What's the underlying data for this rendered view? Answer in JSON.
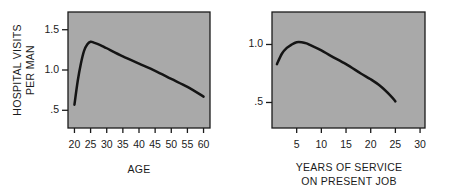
{
  "figure": {
    "background_color": "#ffffff",
    "panel_color": "#a9a9a9",
    "line_color": "#141414"
  },
  "chart_data": [
    {
      "type": "line",
      "title": "",
      "xlabel": "AGE",
      "ylabel": "HOSPITAL VISITS PER MAN",
      "ylabel_line1": "HOSPITAL VISITS",
      "ylabel_line2": "PER MAN",
      "xlim": [
        18,
        62
      ],
      "ylim": [
        0.28,
        1.72
      ],
      "xticks": [
        20,
        25,
        30,
        35,
        40,
        45,
        50,
        55,
        60
      ],
      "xticklabels": [
        "20",
        "25",
        "30",
        "35",
        "40",
        "45",
        "50",
        "55",
        "60"
      ],
      "yticks": [
        0.5,
        1.0,
        1.5
      ],
      "yticklabels": [
        ".5",
        "1.0",
        "1.5"
      ],
      "grid": false,
      "legend": "none",
      "x": [
        20,
        21,
        22,
        23,
        24,
        25,
        26,
        28,
        30,
        35,
        40,
        45,
        50,
        55,
        60
      ],
      "values": [
        0.57,
        0.86,
        1.08,
        1.24,
        1.32,
        1.35,
        1.34,
        1.31,
        1.27,
        1.17,
        1.08,
        0.99,
        0.89,
        0.79,
        0.67
      ]
    },
    {
      "type": "line",
      "title": "",
      "xlabel": "YEARS OF SERVICE ON PRESENT JOB",
      "xlabel_line1": "YEARS OF SERVICE",
      "xlabel_line2": "ON PRESENT JOB",
      "ylabel": "",
      "xlim": [
        0,
        31
      ],
      "ylim": [
        0.28,
        1.28
      ],
      "xticks": [
        5,
        10,
        15,
        20,
        25,
        30
      ],
      "xticklabels": [
        "5",
        "10",
        "15",
        "20",
        "25",
        "30"
      ],
      "yticks": [
        0.5,
        1.0
      ],
      "yticklabels": [
        ".5",
        "1.0"
      ],
      "grid": false,
      "legend": "none",
      "x": [
        1,
        2,
        3,
        4,
        5,
        6,
        7,
        8,
        10,
        12,
        15,
        18,
        20,
        22,
        24,
        25
      ],
      "values": [
        0.83,
        0.92,
        0.97,
        1.0,
        1.02,
        1.02,
        1.01,
        0.99,
        0.95,
        0.9,
        0.83,
        0.75,
        0.7,
        0.64,
        0.56,
        0.51
      ]
    }
  ]
}
